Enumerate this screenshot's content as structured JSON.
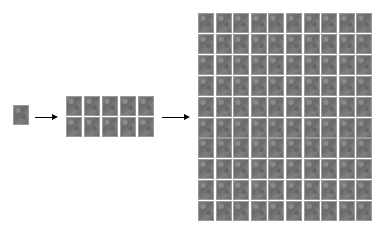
{
  "diagram": {
    "stages": [
      {
        "name": "single",
        "rows": 1,
        "cols": 1,
        "x": 14,
        "y": 106,
        "pitch_x": 18,
        "pitch_y": 21
      },
      {
        "name": "medium",
        "rows": 2,
        "cols": 5,
        "x": 67,
        "y": 97,
        "pitch_x": 18,
        "pitch_y": 21
      },
      {
        "name": "large",
        "rows": 10,
        "cols": 10,
        "x": 199,
        "y": 14,
        "pitch_x": 17.6,
        "pitch_y": 20.9
      }
    ],
    "arrows": [
      {
        "x1": 35,
        "x2": 56,
        "y": 117
      },
      {
        "x1": 162,
        "x2": 188,
        "y": 117
      }
    ],
    "colors": {
      "tile": "#757575",
      "arrow": "#000000",
      "background": "#ffffff"
    }
  }
}
